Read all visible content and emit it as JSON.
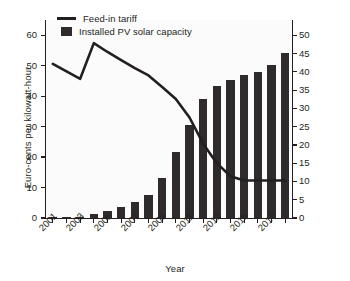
{
  "chart_data": {
    "type": "bar",
    "title": "",
    "xlabel": "Year",
    "ylabel": "Euro-cents per kilowatt-hour",
    "y2label": "Gigawatts",
    "grid": false,
    "legend_position": "top-left",
    "x": [
      2001,
      2002,
      2003,
      2004,
      2005,
      2006,
      2007,
      2008,
      2009,
      2010,
      2011,
      2012,
      2013,
      2014,
      2015,
      2016,
      2017,
      2018
    ],
    "categories": [
      "2001",
      "2002",
      "2003",
      "2004",
      "2005",
      "2006",
      "2007",
      "2008",
      "2009",
      "2010",
      "2011",
      "2012",
      "2013",
      "2014",
      "2015",
      "2016",
      "2017",
      "2018"
    ],
    "xtick_labels": [
      "2001",
      "2003",
      "2005",
      "2007",
      "2009",
      "2011",
      "2013",
      "2015",
      "2017"
    ],
    "xtick_values": [
      2001,
      2003,
      2005,
      2007,
      2009,
      2011,
      2013,
      2015,
      2017
    ],
    "ylim": [
      0,
      65
    ],
    "ytick_labels": [
      "0",
      "10",
      "20",
      "30",
      "40",
      "50",
      "60"
    ],
    "ytick_values": [
      0,
      10,
      20,
      30,
      40,
      50,
      60
    ],
    "y2lim": [
      0,
      54.2
    ],
    "y2tick_labels": [
      "0",
      "5",
      "10",
      "15",
      "20",
      "25",
      "30",
      "35",
      "40",
      "45",
      "50"
    ],
    "y2tick_values": [
      0,
      5,
      10,
      15,
      20,
      25,
      30,
      35,
      40,
      45,
      50
    ],
    "series": [
      {
        "name": "Installed PV solar capacity",
        "type": "bar",
        "axis": "right",
        "unit": "Gigawatts",
        "color": "#2f2b2c",
        "values": [
          0.2,
          0.3,
          0.4,
          1.1,
          1.9,
          3.0,
          4.3,
          6.4,
          11.0,
          18.0,
          25.5,
          32.6,
          36.0,
          37.8,
          39.2,
          40.0,
          41.8,
          45.2
        ]
      },
      {
        "name": "Feed-in tariff",
        "type": "line",
        "axis": "left",
        "unit": "Euro-cents per kilowatt-hour",
        "color": "#231f20",
        "values": [
          50.6,
          48.1,
          45.7,
          57.4,
          54.5,
          51.8,
          49.2,
          46.8,
          43.0,
          39.1,
          33.0,
          24.4,
          18.0,
          13.7,
          12.3,
          12.3,
          12.3,
          12.3
        ]
      }
    ]
  },
  "legend": {
    "items": [
      {
        "label": "Feed-in tariff",
        "marker": "line"
      },
      {
        "label": "Installed PV solar capacity",
        "marker": "square"
      }
    ]
  },
  "axes": {
    "left_title": "Euro-cents per kilowatt-hour",
    "right_title": "Gigawatts",
    "bottom_title": "Year"
  },
  "colors": {
    "bar": "#2f2b2c",
    "line": "#231f20",
    "axis": "#231f20",
    "plot_background": "#fbfbfb",
    "page_background": "#ffffff"
  }
}
